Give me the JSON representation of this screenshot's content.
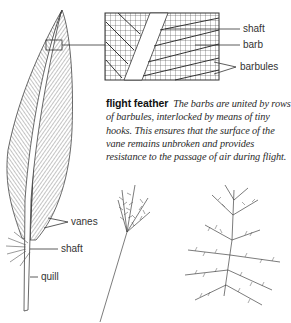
{
  "figure": {
    "title": "flight feather",
    "caption_term": "flight feather",
    "caption_text": "The barbs are united by rows of barbules, interlocked by means of tiny hooks. This ensures that the surface of the vane remains unbroken and provides resistance to the passage of air during flight.",
    "detail_labels": {
      "shaft": "shaft",
      "barb": "barb",
      "barbules": "barbules"
    },
    "feather_labels": {
      "vanes": "vanes",
      "shaft": "shaft",
      "quill": "quill"
    },
    "colors": {
      "ink": "#333333",
      "background": "#ffffff"
    }
  }
}
